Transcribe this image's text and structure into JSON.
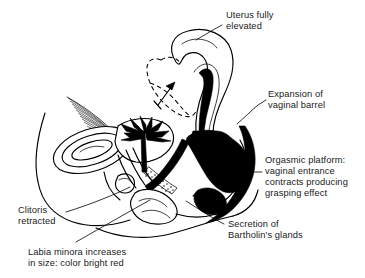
{
  "figure": {
    "style": "black and white line drawing",
    "background_color": "#ffffff",
    "ink_color": "#000000"
  },
  "labels": {
    "uterus": {
      "name": "uterus-elevated",
      "lines": [
        "Uterus fully",
        "elevated"
      ],
      "line1": "Uterus fully",
      "line2": "elevated"
    },
    "vaginal_barrel": {
      "name": "vaginal-barrel-expansion",
      "lines": [
        "Expansion of",
        "vaginal barrel"
      ],
      "line1": "Expansion of",
      "line2": "vaginal barrel"
    },
    "orgasmic_platform": {
      "name": "orgasmic-platform",
      "lines": [
        "Orgasmic platform:",
        "vaginal entrance",
        "contracts producing",
        "grasping effect"
      ],
      "line1": "Orgasmic platform:",
      "line2": "vaginal entrance",
      "line3": "contracts producing",
      "line4": "grasping effect"
    },
    "bartholin": {
      "name": "bartholin-secretion",
      "lines": [
        "Secretion of",
        "Bartholin's glands"
      ],
      "line1": "Secretion of",
      "line2": "Bartholin's glands"
    },
    "clitoris": {
      "name": "clitoris-retracted",
      "lines": [
        "Clitoris",
        "retracted"
      ],
      "line1": "Clitoris",
      "line2": "retracted"
    },
    "labia": {
      "name": "labia-minora",
      "lines": [
        "Labia minora increases",
        "in size: color bright red"
      ],
      "line1": "Labia minora increases",
      "line2": "in size: color bright red"
    }
  }
}
